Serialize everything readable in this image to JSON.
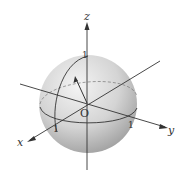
{
  "diagram": {
    "type": "unit-sphere-3d-axes",
    "axes": {
      "x_label": "x",
      "y_label": "y",
      "z_label": "z"
    },
    "origin_label": "O",
    "tick_labels": {
      "x_tick": "1",
      "y_tick": "1",
      "z_tick": "1"
    },
    "colors": {
      "sphere_light": "#f2f2f2",
      "sphere_dark": "#a9a9a9",
      "line": "#333333"
    }
  }
}
